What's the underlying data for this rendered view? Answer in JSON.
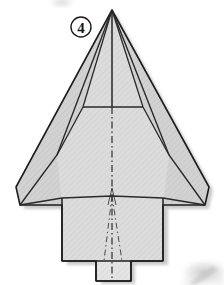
{
  "figure": {
    "step_label": "4",
    "background_color": "#ffffff",
    "paper_fill": "#cfcfcf",
    "paper_fill_light": "#dcdcdc",
    "paper_fill_lighter": "#e3e3e3",
    "outline_color": "#1e1e1e",
    "fold_line_color": "#3a3a3a",
    "shadow_color": "#b0b0b0",
    "hatch_color": "#bdbdbd",
    "step_badge": {
      "name": "step-number-4",
      "label": "4",
      "circle_stroke": "#1a1a1a",
      "circle_fill": "#ffffff",
      "cx": 81,
      "cy": 27,
      "r": 10
    },
    "geometry": {
      "nose_apex": [
        112,
        10
      ],
      "left_wing_tip": [
        16,
        187
      ],
      "right_wing_tip": [
        209,
        187
      ],
      "left_wing_rear": [
        20,
        205
      ],
      "right_wing_rear": [
        205,
        205
      ],
      "body_left": 62,
      "body_right": 163,
      "body_top": 198,
      "body_bottom": 261,
      "tab_left": 96,
      "tab_right": 131,
      "tab_bottom": 281,
      "crossbar_y": 107,
      "crossbar_left": 83,
      "crossbar_right": 143,
      "inner_panel_left_bottom": [
        57,
        155
      ],
      "inner_panel_right_bottom": [
        169,
        155
      ]
    },
    "annotations": {
      "center_line_type": "dash-dot",
      "center_line_label": "valley-fold-center-line",
      "outline_label": "paper-outline",
      "wing_fold_label": "wing-fold-edge"
    },
    "artifacts": {
      "corner_smudge_label": "page-bleed-smudge",
      "top_smudge_label": "top-edge-smudge"
    }
  }
}
